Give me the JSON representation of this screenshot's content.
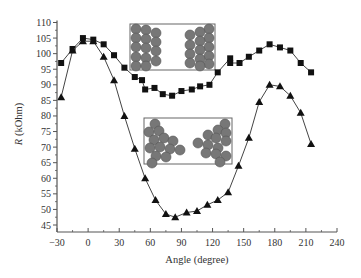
{
  "chart_data": {
    "type": "line",
    "title": "",
    "xlabel": "Angle (degree)",
    "ylabel_italic": "R",
    "ylabel_rest": " (kOhm)",
    "ylabel": "R (kOhm)",
    "xlim": [
      -30,
      240
    ],
    "ylim": [
      43,
      110
    ],
    "xticks": [
      -30,
      0,
      30,
      60,
      90,
      120,
      150,
      180,
      210,
      240
    ],
    "yticks": [
      45,
      50,
      55,
      60,
      65,
      70,
      75,
      80,
      85,
      90,
      95,
      100,
      105,
      110
    ],
    "grid": false,
    "legend": "none",
    "series": [
      {
        "name": "square-markers",
        "marker": "square",
        "x": [
          -26,
          -15,
          -5,
          5,
          15,
          25,
          35,
          45,
          52,
          55,
          64,
          72,
          81,
          90,
          100,
          108,
          117,
          125,
          137,
          137,
          146,
          155,
          165,
          175,
          185,
          195,
          205,
          215
        ],
        "y": [
          97,
          101.5,
          105,
          104.5,
          103,
          99.5,
          95.5,
          92.5,
          91.5,
          88.5,
          89,
          87,
          86.5,
          88,
          88.5,
          89.5,
          90,
          94,
          98.5,
          97,
          97,
          99,
          101,
          103,
          102,
          101,
          97,
          94
        ]
      },
      {
        "name": "triangle-markers",
        "marker": "triangle",
        "x": [
          -26,
          -15,
          -5,
          5,
          15,
          25,
          35,
          45,
          55,
          65,
          75,
          84,
          95,
          105,
          115,
          125,
          135,
          145,
          155,
          165,
          175,
          185,
          195,
          205,
          215
        ],
        "y": [
          86,
          101,
          104,
          104,
          99,
          91.5,
          80,
          69.5,
          60,
          53,
          48.5,
          47.5,
          49,
          49.5,
          51.5,
          53,
          55.5,
          64,
          73,
          84.5,
          90,
          89.5,
          86.5,
          81,
          71
        ]
      }
    ],
    "insets": [
      {
        "name": "top-inset",
        "description": "two separated particle clusters (columns)",
        "box": {
          "x0": 130,
          "y0": 24,
          "x1": 215,
          "y1": 70
        }
      },
      {
        "name": "bottom-inset",
        "description": "two triangular particle clusters",
        "box": {
          "x0": 144,
          "y0": 118,
          "x1": 232,
          "y1": 164
        }
      }
    ]
  },
  "colors": {
    "axis": "#555555",
    "line": "#444444",
    "marker": "#111111",
    "particle_fill": "#777777",
    "particle_stroke": "#555555"
  }
}
